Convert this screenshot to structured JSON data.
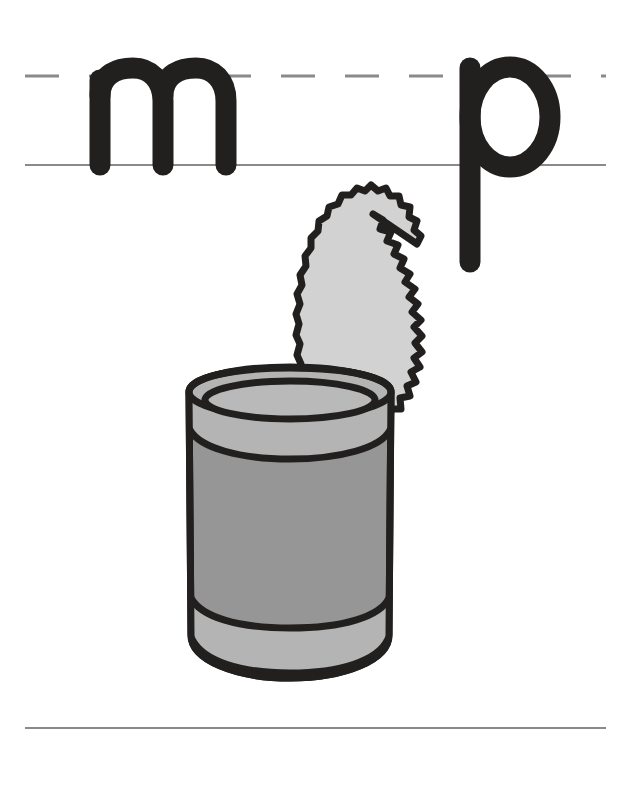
{
  "page": {
    "type": "handwriting-practice-worksheet",
    "width": 619,
    "height": 788,
    "background_color": "#ffffff"
  },
  "guide_lines": {
    "midline": {
      "name": "dashed-midline",
      "style": "dashed",
      "y": 76,
      "x_start": 25,
      "x_end": 606,
      "color": "#8a8a8a",
      "thickness": 3,
      "dash_length": 34,
      "dash_gap": 30
    },
    "baseline": {
      "name": "solid-baseline",
      "style": "solid",
      "y": 165,
      "x_start": 25,
      "x_end": 606,
      "color": "#8a8a8a",
      "thickness": 2
    },
    "bottom_line": {
      "name": "solid-bottom-line",
      "style": "solid",
      "y": 728,
      "x_start": 25,
      "x_end": 606,
      "color": "#8a8a8a",
      "thickness": 2
    }
  },
  "letters": [
    {
      "id": "letter-m",
      "character": "m",
      "label": "lowercase m",
      "x": 85,
      "baseline_y": 165,
      "color": "#221f1f",
      "has_descender": false
    },
    {
      "id": "letter-p",
      "character": "p",
      "label": "lowercase p",
      "x": 455,
      "baseline_y": 165,
      "color": "#221f1f",
      "has_descender": true,
      "descender_bottom_y": 262
    }
  ],
  "illustration": {
    "name": "opened-tin-can",
    "label": "can",
    "description": "An opened tin can with the jagged cut lid standing up behind it",
    "colors": {
      "outline": "#221f1f",
      "body_fill": "#969696",
      "rim_fill": "#b4b4b4",
      "lid_fill": "#d2d2d2",
      "inside_fill": "#b9b9b9"
    },
    "parts": [
      {
        "name": "can-lid",
        "label": "jagged cut lid"
      },
      {
        "name": "can-rim",
        "label": "can rim opening"
      },
      {
        "name": "can-body",
        "label": "can body"
      },
      {
        "name": "can-base",
        "label": "can base bands"
      }
    ],
    "bounds": {
      "x": 182,
      "y": 210,
      "width": 215,
      "height": 470
    }
  }
}
